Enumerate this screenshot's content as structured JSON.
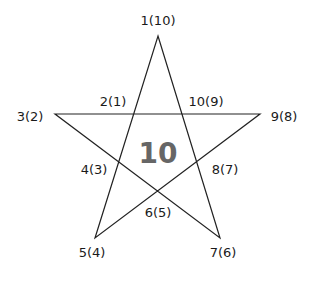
{
  "diagram": {
    "center_value": "10",
    "colors": {
      "line": "#222222",
      "label": "#1a1a1a",
      "center": "#666666"
    },
    "outer_points": [
      {
        "label": "1(10)",
        "x": 158,
        "y": 20
      },
      {
        "label": "3(2)",
        "x": 30,
        "y": 116
      },
      {
        "label": "9(8)",
        "x": 284,
        "y": 116
      },
      {
        "label": "5(4)",
        "x": 92,
        "y": 252
      },
      {
        "label": "7(6)",
        "x": 223,
        "y": 252
      }
    ],
    "inner_points": [
      {
        "label": "2(1)",
        "x": 113,
        "y": 101
      },
      {
        "label": "10(9)",
        "x": 206,
        "y": 101
      },
      {
        "label": "4(3)",
        "x": 94,
        "y": 169
      },
      {
        "label": "8(7)",
        "x": 225,
        "y": 169
      },
      {
        "label": "6(5)",
        "x": 158,
        "y": 212
      }
    ]
  }
}
